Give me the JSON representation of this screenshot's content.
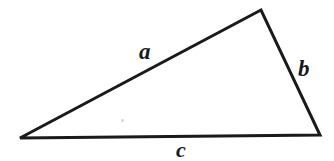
{
  "figure": {
    "kind": "geometry-diagram",
    "shape": "triangle",
    "background_color": "#ffffff",
    "ink_color": "#1a1a1a",
    "stroke_width_px": 3,
    "width_px": 334,
    "height_px": 161,
    "vertices": [
      {
        "name": "left-vertex",
        "x": 20,
        "y": 138
      },
      {
        "name": "apex-vertex",
        "x": 261,
        "y": 10
      },
      {
        "name": "right-vertex",
        "x": 320,
        "y": 135
      }
    ],
    "sides": [
      {
        "id": "side-a",
        "label": "a",
        "from": "left-vertex",
        "to": "apex-vertex",
        "label_position": "above-side"
      },
      {
        "id": "side-b",
        "label": "b",
        "from": "apex-vertex",
        "to": "right-vertex",
        "label_position": "right-of-side"
      },
      {
        "id": "side-c",
        "label": "c",
        "from": "left-vertex",
        "to": "right-vertex",
        "label_position": "below-side"
      }
    ],
    "path_points": "20,138 261,10 320,135 20,138",
    "artifacts": [
      {
        "id": "speck-1",
        "x": 121,
        "y": 119,
        "color": "#d8d8d8"
      }
    ]
  }
}
